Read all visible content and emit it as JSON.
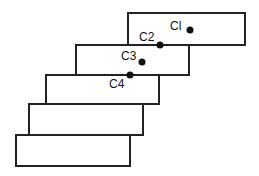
{
  "diagram": {
    "title": "",
    "stroke_color": "#222222",
    "fill_color": "#ffffff",
    "dot_color": "#111111",
    "blocks": [
      {
        "id": "block-1",
        "x": 128,
        "y": 13,
        "w": 117,
        "h": 32
      },
      {
        "id": "block-2",
        "x": 76,
        "y": 45,
        "w": 113,
        "h": 30
      },
      {
        "id": "block-3",
        "x": 46,
        "y": 75,
        "w": 113,
        "h": 29
      },
      {
        "id": "block-4",
        "x": 29,
        "y": 104,
        "w": 114,
        "h": 31
      },
      {
        "id": "block-5",
        "x": 16,
        "y": 135,
        "w": 114,
        "h": 31
      }
    ],
    "points": [
      {
        "id": "C1",
        "label": "Cl",
        "dot_x": 190,
        "dot_y": 30,
        "label_x": 170,
        "label_y": 30
      },
      {
        "id": "C2",
        "label": "C2",
        "dot_x": 160,
        "dot_y": 45,
        "label_x": 139,
        "label_y": 41
      },
      {
        "id": "C3",
        "label": "C3",
        "dot_x": 142,
        "dot_y": 62,
        "label_x": 121,
        "label_y": 60
      },
      {
        "id": "C4",
        "label": "C4",
        "dot_x": 130,
        "dot_y": 75,
        "label_x": 109,
        "label_y": 88
      }
    ]
  }
}
